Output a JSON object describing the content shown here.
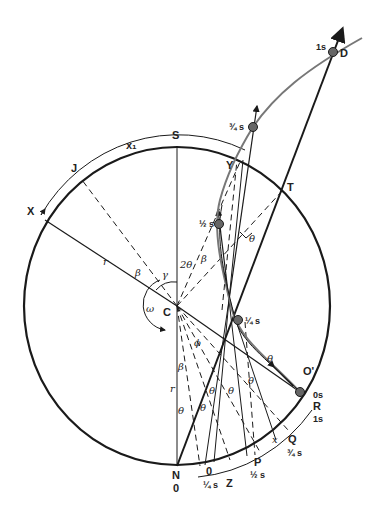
{
  "diagram": {
    "colors": {
      "ink": "#1a1a1a",
      "path": "#777777",
      "dot": "#666666"
    },
    "points": {
      "S": "S",
      "J": "J",
      "X": "X",
      "x1": "x₁",
      "T": "T",
      "Y": "Y",
      "D": "D",
      "C": "C",
      "N": "N",
      "O_prime": "O'",
      "R": "R",
      "Q": "Q",
      "P": "P",
      "Z": "Z",
      "O": "0",
      "x": "x",
      "r_upper": "r",
      "r_lower": "r"
    },
    "times": {
      "D": "1s",
      "three_quarter": "¾ s",
      "half": "½ s",
      "quarter": "¼ s",
      "O_prime": "0s",
      "R": "1s",
      "Q": "¾ s",
      "P": "½ s",
      "O": "¼ s",
      "N": "0"
    },
    "angles": {
      "beta": "β",
      "gamma": "γ",
      "two_theta": "2θ",
      "theta": "θ",
      "omega": "ω",
      "phi": "ϕ"
    }
  }
}
